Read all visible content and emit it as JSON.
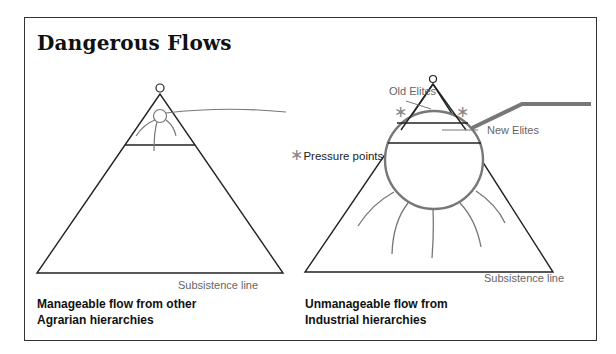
{
  "title": "Dangerous Flows",
  "left_panel": {
    "subsistence_label": "Subsistence line",
    "caption_line1": "Manageable flow from other",
    "caption_line2": "Agrarian hierarchies"
  },
  "right_panel": {
    "old_elites_label": "Old Elites",
    "new_elites_label": "New Elites",
    "pressure_star": "∗",
    "pressure_label": "Pressure points",
    "star_glyph": "∗",
    "subsistence_label": "Subsistence line",
    "caption_line1": "Unmanageable flow from",
    "caption_line2": "Industrial hierarchies"
  },
  "colors": {
    "line": "#222222",
    "flow": "#777777",
    "label": "#666666"
  }
}
